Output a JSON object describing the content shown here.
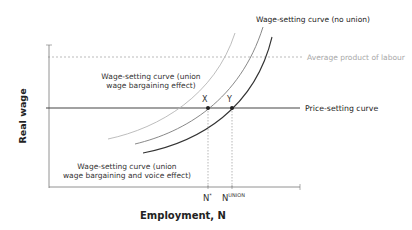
{
  "axes": {
    "y_label": "Real wage",
    "x_label": "Employment, N"
  },
  "lines": {
    "average_product": "Average product of labour",
    "price_setting": "Price-setting curve"
  },
  "curves": {
    "no_union": "Wage-setting curve (no union)",
    "union_wage_line1": "Wage-setting curve (union",
    "union_wage_line2": "wage bargaining effect)",
    "union_voice_line1": "Wage-setting curve (union",
    "union_voice_line2": "wage bargaining and voice effect)"
  },
  "points": {
    "x": "X",
    "y": "Y"
  },
  "ticks": {
    "n_star": "N",
    "n_star_sup": "*",
    "n_union": "N",
    "n_union_sup": "UNION"
  },
  "colors": {
    "axis": "#555555",
    "curve_light": "#b0b0b0",
    "curve_mid": "#777777",
    "curve_dark": "#333333",
    "dashed_ap": "#aaaaaa",
    "ap_text": "#a8a8a8",
    "text": "#222222"
  }
}
